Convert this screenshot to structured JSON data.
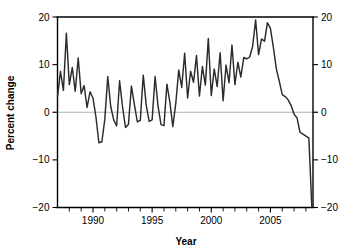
{
  "chart_data": {
    "type": "line",
    "title": "",
    "xlabel": "Year",
    "ylabel": "Percent change",
    "xlim": [
      1987.0,
      2008.6
    ],
    "ylim": [
      -20,
      20
    ],
    "grid": false,
    "legend": "none",
    "zero_reference_line": 0,
    "line_color": "#2b2b2b",
    "zero_line_color": "#b3b3b3",
    "axis_color": "#000000",
    "background_color": "#ffffff",
    "x_tick_labels": [
      "1990",
      "1995",
      "2000",
      "2005"
    ],
    "x_tick_values": [
      1990,
      1995,
      2000,
      2005
    ],
    "x_minor_tick_values": [
      1988,
      1989,
      1991,
      1992,
      1993,
      1994,
      1996,
      1997,
      1998,
      1999,
      2001,
      2002,
      2003,
      2004,
      2006,
      2007,
      2008
    ],
    "y_tick_labels": [
      "20",
      "10",
      "0",
      "-10",
      "-20"
    ],
    "y_tick_values": [
      20,
      10,
      0,
      -10,
      -20
    ],
    "right_axis_tick_labels": [
      "20",
      "10",
      "0",
      "-10",
      "-20"
    ],
    "right_axis_tick_values": [
      20,
      10,
      0,
      -10,
      -20
    ],
    "series": [
      {
        "name": "Percent change",
        "x": [
          1987.0,
          1987.25,
          1987.5,
          1987.75,
          1988.0,
          1988.25,
          1988.5,
          1988.75,
          1989.0,
          1989.25,
          1989.5,
          1989.75,
          1990.0,
          1990.25,
          1990.5,
          1990.75,
          1991.0,
          1991.25,
          1991.5,
          1991.75,
          1992.0,
          1992.25,
          1992.5,
          1992.75,
          1993.0,
          1993.25,
          1993.5,
          1993.75,
          1994.0,
          1994.25,
          1994.5,
          1994.75,
          1995.0,
          1995.25,
          1995.5,
          1995.75,
          1996.0,
          1996.25,
          1996.5,
          1996.75,
          1997.0,
          1997.25,
          1997.5,
          1997.75,
          1998.0,
          1998.25,
          1998.5,
          1998.75,
          1999.0,
          1999.25,
          1999.5,
          1999.75,
          2000.0,
          2000.25,
          2000.5,
          2000.75,
          2001.0,
          2001.25,
          2001.5,
          2001.75,
          2002.0,
          2002.25,
          2002.5,
          2002.75,
          2003.0,
          2003.25,
          2003.5,
          2003.75,
          2004.0,
          2004.25,
          2004.5,
          2004.75,
          2005.0,
          2005.25,
          2005.5,
          2005.75,
          2006.0,
          2006.25,
          2006.5,
          2006.75,
          2007.0,
          2007.25,
          2007.5,
          2007.75,
          2008.0,
          2008.25,
          2008.5
        ],
        "y": [
          3.2,
          8.6,
          4.6,
          16.6,
          5.8,
          9.4,
          4.4,
          11.4,
          3.9,
          5.6,
          1.0,
          4.3,
          3.0,
          -1.0,
          -6.4,
          -6.2,
          -1.5,
          7.5,
          1.2,
          -1.6,
          -2.9,
          6.6,
          1.1,
          -3.2,
          -2.5,
          5.5,
          1.6,
          -2.0,
          -1.7,
          7.8,
          1.5,
          -1.9,
          -1.6,
          7.5,
          1.3,
          -2.6,
          -2.8,
          5.9,
          2.1,
          -3.0,
          1.9,
          8.9,
          5.2,
          12.4,
          3.0,
          8.6,
          6.3,
          11.9,
          3.4,
          9.6,
          5.7,
          15.5,
          3.5,
          9.1,
          5.4,
          12.5,
          2.4,
          9.9,
          6.2,
          14.1,
          5.8,
          10.5,
          7.4,
          11.5,
          11.2,
          11.6,
          13.9,
          19.4,
          12.1,
          15.4,
          14.9,
          18.8,
          17.6,
          13.6,
          9.1,
          6.5,
          3.7,
          3.3,
          2.6,
          1.4,
          -0.4,
          -1.2,
          -4.2,
          -4.6,
          -5.0,
          -5.4,
          -19.9
        ]
      }
    ],
    "annotations": [
      {
        "text": "Strong quarterly seasonality with rising amplitude through 2005"
      },
      {
        "text": "Sharp collapse from 2006 to about -20 percent at the end of the series"
      }
    ]
  },
  "figure": {
    "xlabel": "Year",
    "ylabel": "Percent change"
  }
}
